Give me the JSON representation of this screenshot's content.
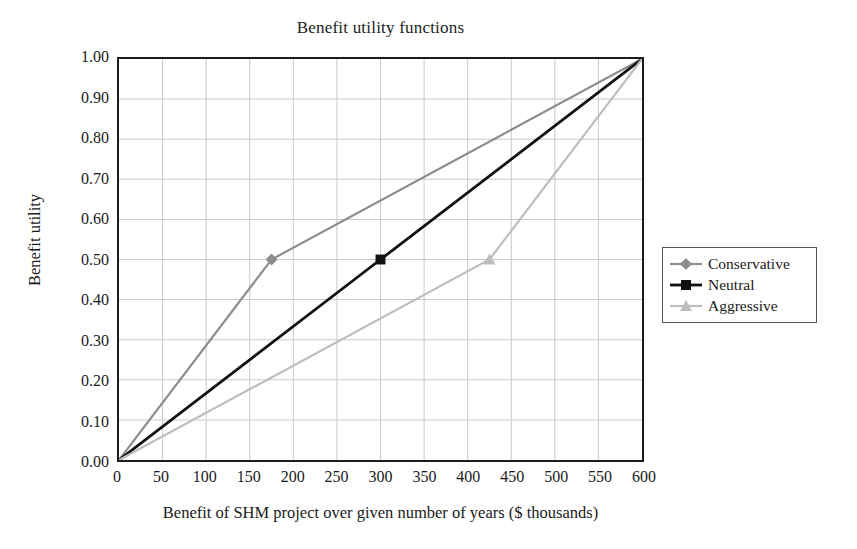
{
  "chart_data": {
    "type": "line",
    "title": "Benefit utility functions",
    "xlabel": "Benefit of SHM project over given number of years ($ thousands)",
    "ylabel": "Benefit utility",
    "xlim": [
      0,
      600
    ],
    "ylim": [
      0.0,
      1.0
    ],
    "xticks": [
      0,
      50,
      100,
      150,
      200,
      250,
      300,
      350,
      400,
      450,
      500,
      550,
      600
    ],
    "xtick_labels": [
      "0",
      "50",
      "100",
      "150",
      "200",
      "250",
      "300",
      "350",
      "400",
      "450",
      "500",
      "550",
      "600"
    ],
    "yticks": [
      0.0,
      0.1,
      0.2,
      0.3,
      0.4,
      0.5,
      0.6,
      0.7,
      0.8,
      0.9,
      1.0
    ],
    "ytick_labels": [
      "0.00",
      "0.10",
      "0.20",
      "0.30",
      "0.40",
      "0.50",
      "0.60",
      "0.70",
      "0.80",
      "0.90",
      "1.00"
    ],
    "grid": true,
    "grid_color": "#c9c9c9",
    "legend_position": "right",
    "series": [
      {
        "name": "Conservative",
        "color": "#8d8d8d",
        "marker": "diamond",
        "line_width": 2.2,
        "x": [
          0,
          175,
          600
        ],
        "y": [
          0.0,
          0.5,
          1.0
        ]
      },
      {
        "name": "Neutral",
        "color": "#111111",
        "marker": "square",
        "line_width": 2.8,
        "x": [
          0,
          300,
          600
        ],
        "y": [
          0.0,
          0.5,
          1.0
        ]
      },
      {
        "name": "Aggressive",
        "color": "#bdbdbd",
        "marker": "triangle",
        "line_width": 2.2,
        "x": [
          0,
          425,
          600
        ],
        "y": [
          0.0,
          0.5,
          1.0
        ]
      }
    ]
  },
  "legend": {
    "items": [
      {
        "label": "Conservative"
      },
      {
        "label": "Neutral"
      },
      {
        "label": "Aggressive"
      }
    ]
  },
  "colors": {
    "axis": "#1c1c1c",
    "grid": "#c9c9c9",
    "text": "#1a1a1a",
    "background": "#ffffff"
  }
}
